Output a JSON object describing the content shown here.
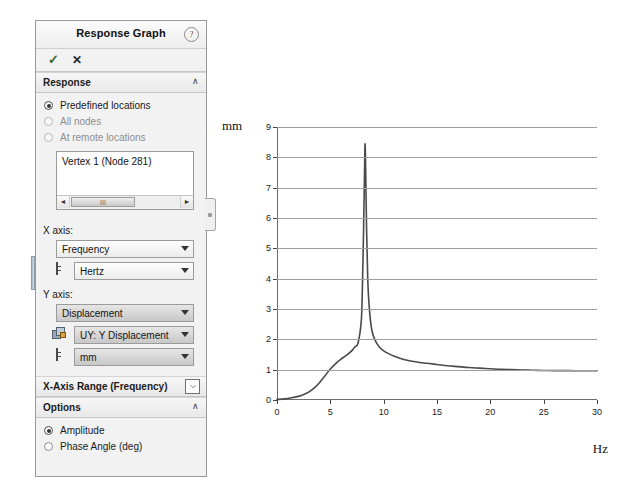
{
  "panel": {
    "title": "Response Graph",
    "help_icon": "help-icon",
    "accept_label": "✓",
    "cancel_label": "✕",
    "sections": [
      {
        "key": "response",
        "label": "Response",
        "caret": "∧",
        "radios": [
          {
            "label": "Predefined locations",
            "selected": true,
            "enabled": true
          },
          {
            "label": "All nodes",
            "selected": false,
            "enabled": false
          },
          {
            "label": "At remote locations",
            "selected": false,
            "enabled": false
          }
        ],
        "listbox": {
          "items": [
            "Vertex 1 (Node 281)"
          ],
          "scroll_left": "◄",
          "scroll_right": "►",
          "thumb_glyph": "III"
        }
      },
      {
        "key": "xaxis",
        "label": "X axis:",
        "fields": [
          {
            "name": "x-quantity",
            "value": "Frequency",
            "icon": "none",
            "shaded": false
          },
          {
            "name": "x-unit",
            "value": "Hertz",
            "icon": "unit-icon",
            "shaded": false
          }
        ]
      },
      {
        "key": "yaxis",
        "label": "Y axis:",
        "fields": [
          {
            "name": "y-quantity",
            "value": "Displacement",
            "icon": "none",
            "shaded": true
          },
          {
            "name": "y-component",
            "value": "UY: Y Displacement",
            "icon": "component-icon",
            "shaded": true
          },
          {
            "name": "y-unit",
            "value": "mm",
            "icon": "unit-icon",
            "shaded": true
          }
        ]
      },
      {
        "key": "xrange",
        "label": "X-Axis Range  (Frequency)",
        "checkbox_glyph": "⌵"
      },
      {
        "key": "options",
        "label": "Options",
        "caret": "∧",
        "radios": [
          {
            "label": "Amplitude",
            "selected": true,
            "enabled": true
          },
          {
            "label": "Phase Angle (deg)",
            "selected": false,
            "enabled": true
          }
        ]
      }
    ]
  },
  "chart_data": {
    "type": "line",
    "title": "",
    "xlabel": "Hz",
    "ylabel": "mm",
    "xlim": [
      0,
      30
    ],
    "ylim": [
      0,
      9
    ],
    "xticks": [
      0,
      5,
      10,
      15,
      20,
      25,
      30
    ],
    "yticks": [
      0,
      1,
      2,
      3,
      4,
      5,
      6,
      7,
      8,
      9
    ],
    "grid": "horizontal",
    "legend": "none",
    "series": [
      {
        "name": "UY: Y Displacement",
        "color": "#4a4a4a",
        "x": [
          0,
          0.5,
          1.0,
          1.5,
          2.0,
          2.5,
          3.0,
          3.5,
          4.0,
          4.5,
          5.0,
          5.5,
          6.0,
          6.5,
          7.0,
          7.3,
          7.6,
          7.9,
          8.0,
          8.1,
          8.2,
          8.25,
          8.3,
          8.4,
          8.5,
          8.6,
          8.8,
          9.0,
          9.3,
          9.6,
          10.0,
          10.5,
          11.0,
          11.5,
          12.0,
          13.0,
          14.0,
          15.0,
          16.0,
          17.0,
          18.0,
          19.0,
          20.0,
          21.0,
          22.0,
          23.0,
          24.0,
          25.0,
          26.0,
          27.0,
          28.0,
          29.0,
          30.0
        ],
        "y": [
          0.02,
          0.03,
          0.05,
          0.08,
          0.12,
          0.18,
          0.27,
          0.4,
          0.58,
          0.8,
          1.02,
          1.2,
          1.35,
          1.47,
          1.62,
          1.75,
          1.88,
          2.6,
          3.6,
          5.3,
          7.4,
          8.42,
          7.9,
          5.6,
          4.1,
          3.3,
          2.5,
          2.15,
          1.9,
          1.75,
          1.62,
          1.52,
          1.44,
          1.38,
          1.33,
          1.26,
          1.21,
          1.17,
          1.13,
          1.1,
          1.07,
          1.05,
          1.03,
          1.01,
          1.0,
          0.99,
          0.98,
          0.975,
          0.97,
          0.968,
          0.966,
          0.965,
          0.965
        ]
      }
    ],
    "annotations": {
      "peak_frequency_hz": 8.25,
      "peak_amplitude_mm": 8.42,
      "settling_amplitude_mm": 0.97
    }
  }
}
